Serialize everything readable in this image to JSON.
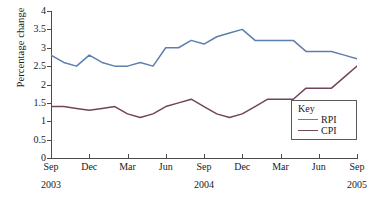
{
  "chart_data": {
    "type": "line",
    "title": "",
    "xlabel": "",
    "ylabel": "Percentage change",
    "ylim": [
      0,
      4
    ],
    "ytick_values": [
      0,
      0.5,
      1,
      1.5,
      2,
      2.5,
      3,
      3.5,
      4
    ],
    "ytick_labels": [
      "0",
      "0.5",
      "1",
      "1.5",
      "2",
      "2.5",
      "3",
      "3.5",
      "4"
    ],
    "grid": false,
    "legend_position": "lower-right",
    "legend_title": "Key",
    "x": [
      "Sep 2003",
      "Oct 2003",
      "Nov 2003",
      "Dec 2003",
      "Jan 2004",
      "Feb 2004",
      "Mar 2004",
      "Apr 2004",
      "May 2004",
      "Jun 2004",
      "Jul 2004",
      "Aug 2004",
      "Sep 2004",
      "Oct 2004",
      "Nov 2004",
      "Dec 2004",
      "Jan 2005",
      "Feb 2005",
      "Mar 2005",
      "Apr 2005",
      "May 2005",
      "Jun 2005",
      "Jul 2005",
      "Aug 2005",
      "Sep 2005"
    ],
    "xtick_labels": [
      "Sep",
      "Dec",
      "Mar",
      "Jun",
      "Sep",
      "Dec",
      "Mar",
      "Jun",
      "Sep"
    ],
    "xtick_indices": [
      0,
      3,
      6,
      9,
      12,
      15,
      18,
      21,
      24
    ],
    "year_labels": [
      {
        "text": "2003",
        "index": 0
      },
      {
        "text": "2004",
        "index": 12
      },
      {
        "text": "2005",
        "index": 24
      }
    ],
    "series": [
      {
        "name": "RPI",
        "color": "#5d7fae",
        "values": [
          2.8,
          2.6,
          2.5,
          2.8,
          2.6,
          2.5,
          2.5,
          2.6,
          2.5,
          3.0,
          3.0,
          3.2,
          3.1,
          3.3,
          3.4,
          3.5,
          3.2,
          3.2,
          3.2,
          3.2,
          2.9,
          2.9,
          2.9,
          2.8,
          2.7
        ]
      },
      {
        "name": "CPI",
        "color": "#70455c",
        "values": [
          1.4,
          1.4,
          1.35,
          1.3,
          1.35,
          1.4,
          1.2,
          1.1,
          1.2,
          1.4,
          1.5,
          1.6,
          1.4,
          1.2,
          1.1,
          1.2,
          1.4,
          1.6,
          1.6,
          1.6,
          1.9,
          1.9,
          1.9,
          2.2,
          2.5
        ]
      }
    ]
  }
}
